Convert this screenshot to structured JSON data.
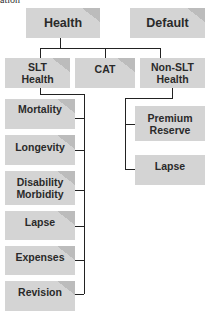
{
  "caption": "ation",
  "top_level": [
    {
      "label": "Health"
    },
    {
      "label": "Default"
    }
  ],
  "health_children": [
    {
      "label": "SLT Health"
    },
    {
      "label": "CAT"
    },
    {
      "label": "Non-SLT Health"
    }
  ],
  "slt_children": [
    {
      "label": "Mortality"
    },
    {
      "label": "Longevity"
    },
    {
      "label": "Disability Morbidity"
    },
    {
      "label": "Lapse"
    },
    {
      "label": "Expenses"
    },
    {
      "label": "Revision"
    }
  ],
  "non_slt_children": [
    {
      "label": "Premium Reserve"
    },
    {
      "label": "Lapse"
    }
  ],
  "colors": {
    "box_fill": "#d4d4d4",
    "box_corner": "#bcbcbc",
    "connector": "#222222",
    "text": "#2a2a2a"
  }
}
